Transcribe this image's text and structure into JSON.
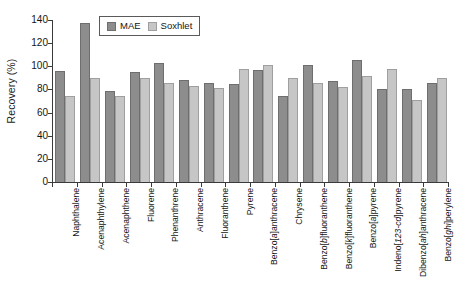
{
  "chart_data": {
    "type": "bar",
    "title": "",
    "xlabel": "",
    "ylabel": "Recovery (%)",
    "ylim": [
      0,
      140
    ],
    "yticks": [
      0,
      20,
      40,
      60,
      80,
      100,
      120,
      140
    ],
    "ytick_labels": [
      "0",
      "20",
      "40",
      "60",
      "80",
      "100",
      "120",
      "140"
    ],
    "grid": false,
    "legend_position": "top-left-inside",
    "categories": [
      "Naphthalene",
      "Acenaphthylene",
      "Acenaphthene",
      "Fluorene",
      "Phenanthrene",
      "Anthracene",
      "Fluoranthene",
      "Pyrene",
      "Benzo[a]anthracene",
      "Chrysene",
      "Benzo[b]fluoranthene",
      "Benzo[k]fluoranthene",
      "Benzo[a]pyrene",
      "Indeno[123-cd]pyrene",
      "Dibenzo[ah]anthracene",
      "Benzo[ghi]perylene"
    ],
    "series": [
      {
        "name": "MAE",
        "color": "#8d8d8d",
        "values": [
          96,
          137,
          78.5,
          95,
          102.5,
          88,
          86,
          85,
          97,
          74.5,
          101,
          87,
          105.5,
          80,
          80.5,
          85.5
        ]
      },
      {
        "name": "Soxhlet",
        "color": "#c6c6c6",
        "values": [
          74.5,
          89.5,
          74.5,
          89.5,
          85.5,
          83,
          81.5,
          98,
          101,
          89.5,
          85.5,
          82.5,
          91.5,
          97.5,
          71,
          90
        ]
      }
    ]
  },
  "legend": {
    "items": [
      {
        "label": "MAE",
        "color": "#8d8d8d"
      },
      {
        "label": "Soxhlet",
        "color": "#c6c6c6"
      }
    ]
  },
  "axes": {
    "y_title": "Recovery (%)"
  }
}
